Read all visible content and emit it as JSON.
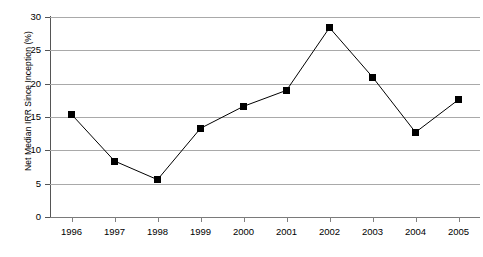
{
  "chart_data": {
    "type": "line",
    "title": "",
    "xlabel": "",
    "ylabel": "Net Median IRR Since Inception (%)",
    "categories": [
      "1996",
      "1997",
      "1998",
      "1999",
      "2000",
      "2001",
      "2002",
      "2003",
      "2004",
      "2005"
    ],
    "values": [
      15.4,
      8.4,
      5.6,
      13.3,
      16.6,
      19.0,
      28.4,
      21.0,
      12.7,
      17.6
    ],
    "ylim": [
      0,
      30
    ],
    "yticks": [
      0,
      5,
      10,
      15,
      20,
      25,
      30
    ],
    "ytick_labels": [
      "0",
      "5",
      "10",
      "15",
      "20",
      "25",
      "30"
    ],
    "grid": true,
    "legend": "none",
    "marker": "square",
    "series_color": "#000000",
    "gridline_color": "#a9a9a9",
    "axis_color": "#555555"
  }
}
